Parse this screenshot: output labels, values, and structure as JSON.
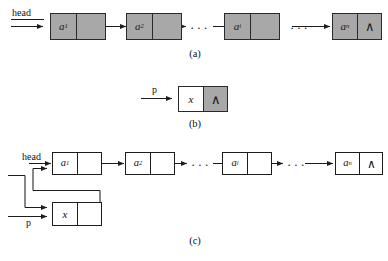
{
  "figure": {
    "null_symbol": "∧",
    "ellipsis": "···",
    "colors": {
      "node_fill_gray": "#a8a8a8",
      "node_fill_white": "#ffffff",
      "border_dark": "#2a2a2a",
      "border_thin": "#1d1d1d",
      "wire": "#1d1d1d",
      "background": "#ffffff"
    }
  },
  "panels": [
    {
      "id": "a",
      "caption": "(a)",
      "pointer_label": "head",
      "nodes": [
        {
          "name": "node-a1",
          "data": "a",
          "subscript": "1",
          "link": ""
        },
        {
          "name": "node-a2",
          "data": "a",
          "subscript": "2",
          "link": ""
        },
        {
          "name": "node-ai",
          "data": "a",
          "subscript": "i",
          "link": ""
        },
        {
          "name": "node-an",
          "data": "a",
          "subscript": "n",
          "link": "∧"
        }
      ]
    },
    {
      "id": "b",
      "caption": "(b)",
      "pointer_label": "p",
      "nodes": [
        {
          "name": "node-x",
          "data": "x",
          "subscript": "",
          "link": "∧"
        }
      ]
    },
    {
      "id": "c",
      "caption": "(c)",
      "pointer_label_head": "head",
      "pointer_label_p": "p",
      "nodes": [
        {
          "name": "node-c-a1",
          "data": "a",
          "subscript": "1",
          "link": ""
        },
        {
          "name": "node-c-a2",
          "data": "a",
          "subscript": "2",
          "link": ""
        },
        {
          "name": "node-c-ai",
          "data": "a",
          "subscript": "i",
          "link": ""
        },
        {
          "name": "node-c-an",
          "data": "a",
          "subscript": "n",
          "link": "∧"
        },
        {
          "name": "node-c-x",
          "data": "x",
          "subscript": "",
          "link": ""
        }
      ]
    }
  ]
}
